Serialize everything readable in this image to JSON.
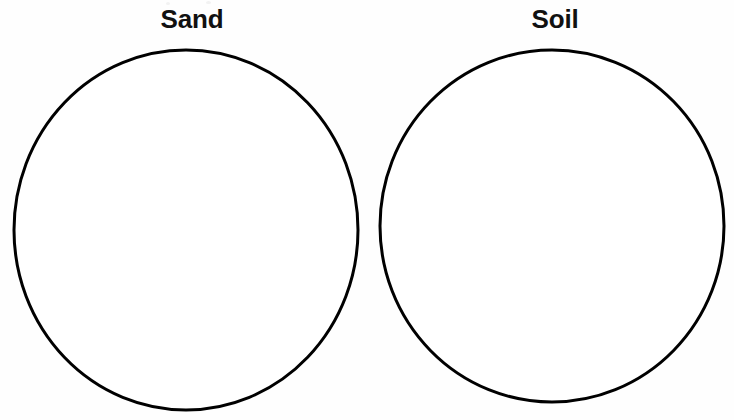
{
  "page": {
    "background_color": "#fefefe",
    "width": 734,
    "height": 420
  },
  "worksheet": {
    "type": "sorting-circles",
    "stroke_color": "#000000",
    "stroke_width": 3,
    "fill_color": "#ffffff",
    "label_color": "#111111",
    "circles": [
      {
        "id": "sand",
        "label": "Sand",
        "cx": 186,
        "cy": 230,
        "rx": 172,
        "ry": 180
      },
      {
        "id": "soil",
        "label": "Soil",
        "cx": 552,
        "cy": 226,
        "rx": 172,
        "ry": 176
      }
    ]
  },
  "labels": {
    "sand": "Sand",
    "soil": "Soil"
  }
}
